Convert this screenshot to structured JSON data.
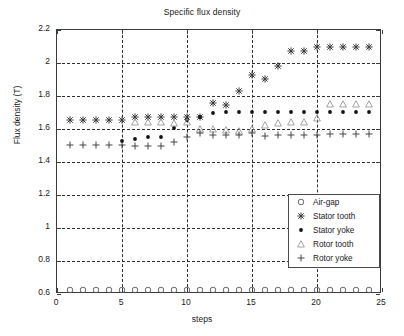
{
  "chart_data": {
    "type": "scatter",
    "title": "Specific flux density",
    "xlabel": "steps",
    "ylabel": "Flux density (T)",
    "xlim": [
      0,
      25
    ],
    "ylim": [
      0.6,
      2.2
    ],
    "xticks": [
      0,
      5,
      10,
      15,
      20,
      25
    ],
    "yticks": [
      0.6,
      0.8,
      1,
      1.2,
      1.4,
      1.6,
      1.8,
      2,
      2.2
    ],
    "ytick_labels": [
      "0.6",
      "0.8",
      "1",
      "1.2",
      "1.4",
      "1.6",
      "1.8",
      "2",
      "2.2"
    ],
    "xtick_labels": [
      "0",
      "5",
      "10",
      "15",
      "20",
      "25"
    ],
    "grid": true,
    "grid_style": "dashed",
    "legend_position": "lower right",
    "x": [
      1,
      2,
      3,
      4,
      5,
      6,
      7,
      8,
      9,
      10,
      11,
      12,
      13,
      14,
      15,
      16,
      17,
      18,
      19,
      20,
      21,
      22,
      23,
      24
    ],
    "series": [
      {
        "name": "Air-gap",
        "marker": "circle",
        "color": "#555555",
        "values": [
          0.625,
          0.625,
          0.625,
          0.625,
          0.625,
          0.625,
          0.625,
          0.625,
          0.625,
          0.625,
          0.625,
          0.625,
          0.625,
          0.625,
          0.625,
          0.625,
          0.625,
          0.625,
          0.625,
          0.625,
          0.625,
          0.625,
          0.625,
          0.625
        ]
      },
      {
        "name": "Stator tooth",
        "marker": "star",
        "color": "#3a3a3a",
        "values": [
          1.655,
          1.655,
          1.655,
          1.655,
          1.655,
          1.67,
          1.67,
          1.67,
          1.67,
          1.67,
          1.675,
          1.76,
          1.745,
          1.83,
          1.925,
          1.905,
          1.98,
          2.075,
          2.07,
          2.1,
          2.1,
          2.1,
          2.1,
          2.1
        ]
      },
      {
        "name": "Stator yoke",
        "marker": "dot",
        "color": "#111111",
        "values": [
          null,
          null,
          null,
          null,
          1.525,
          1.54,
          1.55,
          1.55,
          1.605,
          1.655,
          1.675,
          1.7,
          1.705,
          1.705,
          1.705,
          1.705,
          1.705,
          1.705,
          1.705,
          1.705,
          1.705,
          1.705,
          1.705,
          1.705
        ]
      },
      {
        "name": "Rotor tooth",
        "marker": "triangle",
        "color": "#9a9a9a",
        "values": [
          null,
          null,
          null,
          null,
          null,
          1.645,
          1.645,
          1.645,
          1.635,
          1.64,
          1.6,
          1.6,
          1.595,
          1.59,
          1.6,
          1.625,
          1.635,
          1.64,
          1.64,
          1.665,
          1.75,
          1.75,
          1.75,
          1.75
        ]
      },
      {
        "name": "Rotor yoke",
        "marker": "plus",
        "color": "#444444",
        "values": [
          1.505,
          1.505,
          1.505,
          1.505,
          1.505,
          1.5,
          1.5,
          1.5,
          1.52,
          1.55,
          1.575,
          1.565,
          1.565,
          1.565,
          1.575,
          1.555,
          1.565,
          1.565,
          1.565,
          1.565,
          1.57,
          1.57,
          1.57,
          1.57
        ]
      }
    ]
  },
  "legend": {
    "entries": [
      {
        "label": "Air-gap"
      },
      {
        "label": "Stator tooth"
      },
      {
        "label": "Stator yoke"
      },
      {
        "label": "Rotor tooth"
      },
      {
        "label": "Rotor yoke"
      }
    ]
  }
}
